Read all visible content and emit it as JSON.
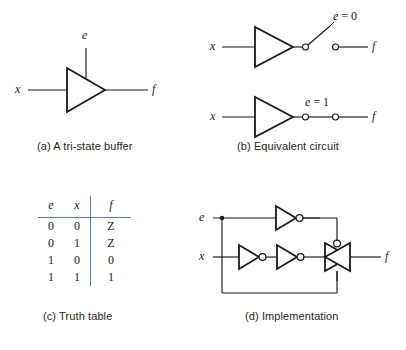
{
  "figure": {
    "panels": [
      {
        "id": "a",
        "caption": "(a) A tri-state buffer",
        "labels": {
          "input": "x",
          "enable": "e",
          "output": "f"
        }
      },
      {
        "id": "b",
        "caption": "(b) Equivalent circuit",
        "rows": [
          {
            "input": "x",
            "output": "f",
            "condition": "e = 0",
            "condition_var": "e",
            "condition_eq": "=",
            "condition_value": "0",
            "switch_state": "open"
          },
          {
            "input": "x",
            "output": "f",
            "condition": "e = 1",
            "condition_var": "e",
            "condition_eq": "=",
            "condition_value": "1",
            "switch_state": "closed"
          }
        ]
      },
      {
        "id": "c",
        "caption": "(c) Truth table",
        "table": {
          "headers": [
            "e",
            "x",
            "f"
          ],
          "rows": [
            [
              "0",
              "0",
              "Z"
            ],
            [
              "0",
              "1",
              "Z"
            ],
            [
              "1",
              "0",
              "0"
            ],
            [
              "1",
              "1",
              "1"
            ]
          ],
          "rule_color": "#4a7ebb"
        }
      },
      {
        "id": "d",
        "caption": "(d) Implementation",
        "labels": {
          "enable": "e",
          "input": "x",
          "output": "f"
        }
      }
    ]
  },
  "colors": {
    "ink": "#1a1a1a",
    "rule_blue": "#4a7ebb",
    "caption_ink": "#231f20",
    "background": "#ffffff"
  }
}
